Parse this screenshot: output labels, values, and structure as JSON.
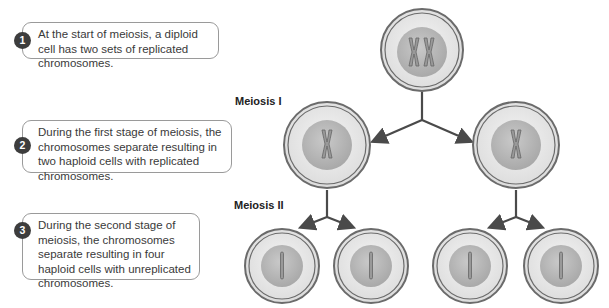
{
  "steps": [
    {
      "number": "1",
      "text": "At the start of meiosis, a diploid cell has two sets of replicated chromosomes."
    },
    {
      "number": "2",
      "text": "During the first stage of meiosis, the chromosomes separate resulting in two haploid cells with replicated chromosomes."
    },
    {
      "number": "3",
      "text": "During the second stage of meiosis, the chromosomes separate resulting in four haploid cells with unreplicated chromosomes."
    }
  ],
  "stages": {
    "meiosis_1": "Meiosis I",
    "meiosis_2": "Meiosis II"
  },
  "colors": {
    "badge": "#3d3d3d",
    "arrow": "#4a4a4a",
    "cell_ring": "#6b6b6b",
    "nucleus": "#b8b8b8",
    "chromosome": "#8f8f8f"
  }
}
